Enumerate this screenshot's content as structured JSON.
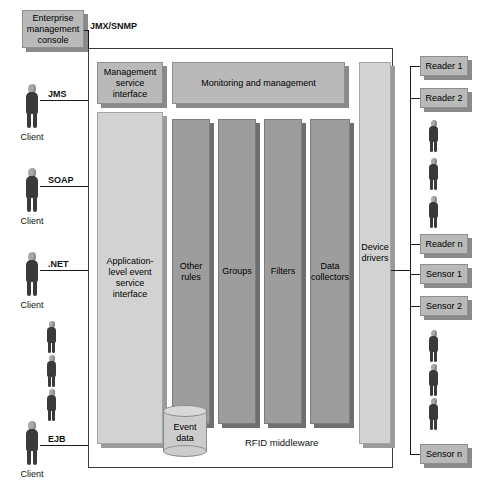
{
  "diagram": {
    "colors": {
      "box_fill": "#b9b9b9",
      "light_fill": "#d2d2d2",
      "dark_column": "#9d9d9d",
      "line": "#1a1a1a",
      "shadow": "#8a8a8a",
      "background": "#ffffff"
    }
  },
  "console": {
    "label": "Enterprise\nmanagement\nconsole",
    "line1": "Enterprise",
    "line2": "management",
    "line3": "console",
    "protocol": "JMX/SNMP"
  },
  "clients": [
    {
      "name": "Client",
      "protocol": "JMS"
    },
    {
      "name": "Client",
      "protocol": "SOAP"
    },
    {
      "name": "Client",
      "protocol": ".NET"
    },
    {
      "name": "Client",
      "protocol": "EJB"
    }
  ],
  "middleware": {
    "caption": "RFID middleware",
    "management_service_interface": {
      "line1": "Management",
      "line2": "service",
      "line3": "interface"
    },
    "application_service_interface": {
      "line1": "Application-",
      "line2": "level event",
      "line3": "service",
      "line4": "interface"
    },
    "monitoring_bar": "Monitoring and management",
    "columns": [
      {
        "line1": "Other",
        "line2": "rules"
      },
      {
        "line1": "Groups",
        "line2": ""
      },
      {
        "line1": "Filters",
        "line2": ""
      },
      {
        "line1": "Data",
        "line2": "collectors"
      }
    ],
    "device_drivers": {
      "line1": "Device",
      "line2": "drivers"
    },
    "event_store": {
      "line1": "Event",
      "line2": "data"
    }
  },
  "devices": {
    "readers": [
      {
        "label": "Reader 1"
      },
      {
        "label": "Reader 2"
      },
      {
        "label": "Reader n"
      }
    ],
    "sensors": [
      {
        "label": "Sensor 1"
      },
      {
        "label": "Sensor 2"
      },
      {
        "label": "Sensor n"
      }
    ]
  }
}
